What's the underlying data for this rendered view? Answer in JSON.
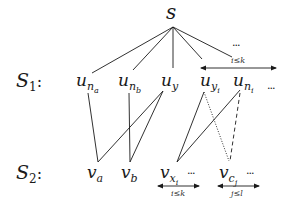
{
  "diagram": {
    "root": {
      "label": "s"
    },
    "rows": [
      {
        "id": "S1",
        "label_main": "S",
        "label_sub": "1",
        "label_suffix": ":",
        "nodes": [
          {
            "id": "u_na",
            "base": "u",
            "sub": "n",
            "subsub": "a"
          },
          {
            "id": "u_nb",
            "base": "u",
            "sub": "n",
            "subsub": "b"
          },
          {
            "id": "u_y",
            "base": "u",
            "sub": "y",
            "subsub": ""
          },
          {
            "id": "u_yi",
            "base": "u",
            "sub": "y",
            "subsub": "i"
          },
          {
            "id": "u_ni",
            "base": "u",
            "sub": "n",
            "subsub": "i"
          }
        ],
        "trailing_dots": "...",
        "above_dots": "...",
        "range_label": "i≤k"
      },
      {
        "id": "S2",
        "label_main": "S",
        "label_sub": "2",
        "label_suffix": ":",
        "nodes": [
          {
            "id": "v_a",
            "base": "v",
            "sub": "a",
            "subsub": ""
          },
          {
            "id": "v_b",
            "base": "v",
            "sub": "b",
            "subsub": ""
          },
          {
            "id": "v_xi",
            "base": "v",
            "sub": "x",
            "subsub": "i"
          },
          {
            "id": "v_cj",
            "base": "v",
            "sub": "c",
            "subsub": "j"
          }
        ],
        "dots_after_xi": "...",
        "dots_after_cj": "...",
        "range_labels": [
          "i≤k",
          "j≤l"
        ]
      }
    ],
    "edges": [
      {
        "from": "s",
        "to": "u_na",
        "style": "solid"
      },
      {
        "from": "s",
        "to": "u_nb",
        "style": "solid"
      },
      {
        "from": "s",
        "to": "u_y",
        "style": "solid"
      },
      {
        "from": "s",
        "to": "u_yi",
        "style": "solid"
      },
      {
        "from": "s",
        "to": "u_ni",
        "style": "solid"
      },
      {
        "from": "u_na",
        "to": "v_a",
        "style": "solid"
      },
      {
        "from": "u_nb",
        "to": "v_b",
        "style": "solid"
      },
      {
        "from": "u_y",
        "to": "v_a",
        "style": "solid"
      },
      {
        "from": "u_y",
        "to": "v_b",
        "style": "solid"
      },
      {
        "from": "u_yi",
        "to": "v_xi",
        "style": "solid"
      },
      {
        "from": "u_ni",
        "to": "v_xi",
        "style": "solid"
      },
      {
        "from": "u_yi",
        "to": "v_cj",
        "style": "dotted"
      },
      {
        "from": "u_ni",
        "to": "v_cj",
        "style": "dashed"
      }
    ],
    "colors": {
      "stroke": "#1a1a1a",
      "background": "#ffffff"
    }
  }
}
